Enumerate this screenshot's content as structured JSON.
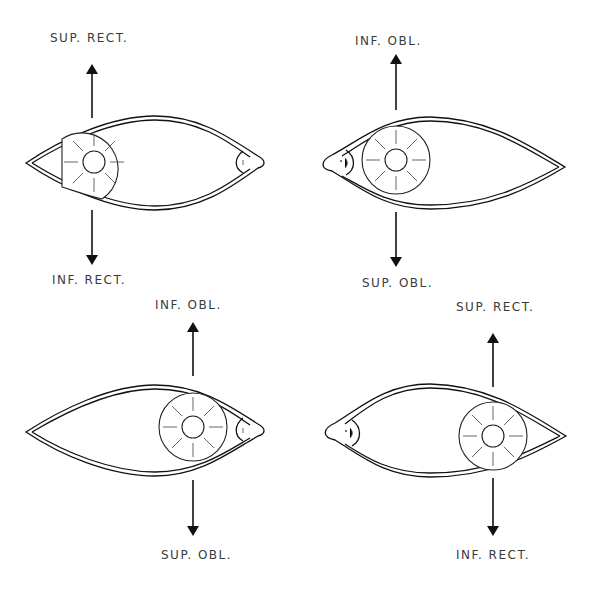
{
  "figure": {
    "type": "diagram",
    "panels": [
      {
        "id": "top-left",
        "up_label": "SUP. RECT.",
        "down_label": "INF. RECT.",
        "iris_position": "left",
        "caruncle_side": "right"
      },
      {
        "id": "top-right",
        "up_label": "INF. OBL.",
        "down_label": "SUP. OBL.",
        "iris_position": "left",
        "caruncle_side": "left"
      },
      {
        "id": "bottom-left",
        "up_label": "INF. OBL.",
        "down_label": "SUP. OBL.",
        "iris_position": "right",
        "caruncle_side": "right"
      },
      {
        "id": "bottom-right",
        "up_label": "SUP. RECT.",
        "down_label": "INF. RECT.",
        "iris_position": "right",
        "caruncle_side": "left"
      }
    ]
  },
  "colors": {
    "line": "#111111",
    "label": "#3a3a3a",
    "background": "#ffffff"
  }
}
